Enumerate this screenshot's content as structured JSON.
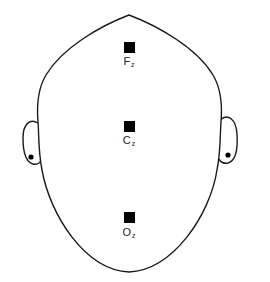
{
  "diagram": {
    "type": "eeg-electrode-placement",
    "view": "top-of-head",
    "colors": {
      "outline": "#1a1a1a",
      "electrode": "#000000",
      "background": "#ffffff",
      "label": "#222222"
    },
    "electrodes": [
      {
        "id": "Fz",
        "letter": "F",
        "subscript": "z",
        "x": 129,
        "y": 47
      },
      {
        "id": "Cz",
        "letter": "C",
        "subscript": "z",
        "x": 129,
        "y": 126
      },
      {
        "id": "Oz",
        "letter": "O",
        "subscript": "z",
        "x": 129,
        "y": 218
      }
    ],
    "ears": [
      {
        "side": "left",
        "has_reference_dot": true
      },
      {
        "side": "right",
        "has_reference_dot": true
      }
    ]
  }
}
